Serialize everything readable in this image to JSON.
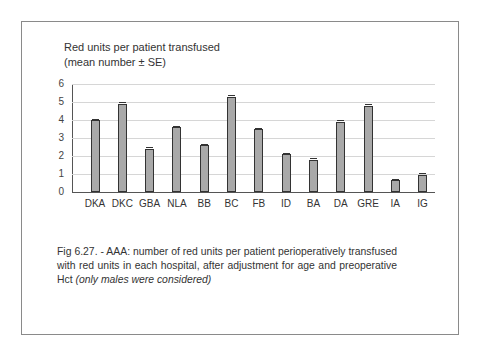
{
  "chart_data": {
    "type": "bar",
    "title": "Red units per patient transfused (mean number ± SE)",
    "ylabel_line1": "Red units per patient transfused",
    "ylabel_line2": "(mean number  ±  SE)",
    "xlabel": "",
    "categories": [
      "DKA",
      "DKC",
      "GBA",
      "NLA",
      "BB",
      "BC",
      "FB",
      "ID",
      "BA",
      "DA",
      "GRE",
      "IA",
      "IG"
    ],
    "values": [
      4.0,
      4.9,
      2.4,
      3.6,
      2.6,
      5.3,
      3.5,
      2.1,
      1.8,
      3.9,
      4.8,
      0.65,
      0.95
    ],
    "error_bars": "± SE (small)",
    "ylim": [
      0,
      6
    ],
    "yticks": [
      "0",
      "1",
      "2",
      "3",
      "4",
      "5",
      "6"
    ],
    "grid": true,
    "bar_color": "#a9a9a9",
    "legend": null
  },
  "caption": {
    "main": "Fig 6.27. - AAA: number of red units per patient perioperatively transfused with red units in each hospital, after adjustment for age and preoperative Hct",
    "italic": "(only males were considered)"
  }
}
